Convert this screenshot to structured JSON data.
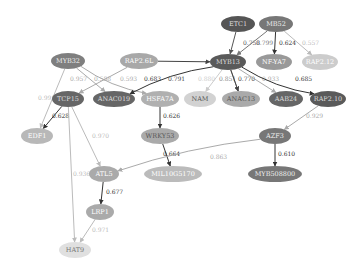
{
  "nodes": [
    {
      "id": "ETC1",
      "label": "ETC1",
      "x": 238,
      "y": 24,
      "rx": 17,
      "ry": 8,
      "fill": "#555555",
      "text": "#dddddd"
    },
    {
      "id": "MB52",
      "label": "MB52",
      "x": 276,
      "y": 24,
      "rx": 17,
      "ry": 8,
      "fill": "#777777",
      "text": "#eeeeee"
    },
    {
      "id": "MYB32",
      "label": "MYB32",
      "x": 68,
      "y": 61,
      "rx": 17,
      "ry": 8,
      "fill": "#7f7f7f",
      "text": "#eeeeee"
    },
    {
      "id": "RAP26L",
      "label": "RAP2.6L",
      "x": 139,
      "y": 61,
      "rx": 19,
      "ry": 8,
      "fill": "#a8a8a8",
      "text": "#ffffff"
    },
    {
      "id": "MYB13",
      "label": "MYB13",
      "x": 228,
      "y": 62,
      "rx": 18,
      "ry": 8,
      "fill": "#5a5a5a",
      "text": "#dddddd"
    },
    {
      "id": "NFYA7",
      "label": "NF-YA7",
      "x": 274,
      "y": 62,
      "rx": 18,
      "ry": 8,
      "fill": "#999999",
      "text": "#ffffff"
    },
    {
      "id": "RAP212",
      "label": "RAP2.12",
      "x": 320,
      "y": 62,
      "rx": 18,
      "ry": 8,
      "fill": "#cccccc",
      "text": "#ffffff"
    },
    {
      "id": "TCP15",
      "label": "TCP15",
      "x": 68,
      "y": 99,
      "rx": 16,
      "ry": 8,
      "fill": "#666666",
      "text": "#dddddd"
    },
    {
      "id": "ANAC019",
      "label": "ANAC019",
      "x": 114,
      "y": 99,
      "rx": 21,
      "ry": 8,
      "fill": "#666666",
      "text": "#dddddd"
    },
    {
      "id": "HSFA7A",
      "label": "HSFA7A",
      "x": 160,
      "y": 99,
      "rx": 19,
      "ry": 8,
      "fill": "#b0b0b0",
      "text": "#ffffff"
    },
    {
      "id": "NAM",
      "label": "NAM",
      "x": 200,
      "y": 99,
      "rx": 16,
      "ry": 8,
      "fill": "#d2d2d2",
      "text": "#555555"
    },
    {
      "id": "ANAC13",
      "label": "ANAC13",
      "x": 241,
      "y": 99,
      "rx": 19,
      "ry": 8,
      "fill": "#aaaaaa",
      "text": "#555555"
    },
    {
      "id": "AAB24",
      "label": "AAB24",
      "x": 286,
      "y": 99,
      "rx": 17,
      "ry": 8,
      "fill": "#666666",
      "text": "#dddddd"
    },
    {
      "id": "RAP210",
      "label": "RAP2.10",
      "x": 328,
      "y": 99,
      "rx": 18,
      "ry": 8,
      "fill": "#5a5a5a",
      "text": "#dddddd"
    },
    {
      "id": "EDF1",
      "label": "EDF1",
      "x": 37,
      "y": 136,
      "rx": 16,
      "ry": 8,
      "fill": "#b8b8b8",
      "text": "#ffffff"
    },
    {
      "id": "WRKY53",
      "label": "WRKY53",
      "x": 160,
      "y": 136,
      "rx": 19,
      "ry": 8,
      "fill": "#aaaaaa",
      "text": "#555555"
    },
    {
      "id": "AZF3",
      "label": "AZF3",
      "x": 275,
      "y": 136,
      "rx": 16,
      "ry": 8,
      "fill": "#777777",
      "text": "#eeeeee"
    },
    {
      "id": "ATL5",
      "label": "ATL5",
      "x": 104,
      "y": 174,
      "rx": 15,
      "ry": 8,
      "fill": "#aaaaaa",
      "text": "#ffffff"
    },
    {
      "id": "MIL",
      "label": "MIL10G5170",
      "x": 173,
      "y": 174,
      "rx": 29,
      "ry": 8,
      "fill": "#bbbbbb",
      "text": "#ffffff"
    },
    {
      "id": "MYB",
      "label": "MYB508800",
      "x": 275,
      "y": 174,
      "rx": 27,
      "ry": 8,
      "fill": "#777777",
      "text": "#eeeeee"
    },
    {
      "id": "LRP1",
      "label": "LRP1",
      "x": 100,
      "y": 212,
      "rx": 14,
      "ry": 8,
      "fill": "#aaaaaa",
      "text": "#ffffff"
    },
    {
      "id": "HAT9",
      "label": "HAT9",
      "x": 75,
      "y": 250,
      "rx": 16,
      "ry": 8,
      "fill": "#e0e0e0",
      "text": "#777777"
    }
  ],
  "edges": [
    {
      "from": "ETC1",
      "to": "MYB13",
      "label": "0.758",
      "color": "#555555",
      "lx": 243,
      "ly": 45
    },
    {
      "from": "MB52",
      "to": "MYB13",
      "label": "0.799",
      "color": "#777777",
      "lx": 256,
      "ly": 45
    },
    {
      "from": "MB52",
      "to": "NFYA7",
      "label": "0.624",
      "color": "#333333",
      "lx": 279,
      "ly": 45
    },
    {
      "from": "MB52",
      "to": "RAP212",
      "label": "0.557",
      "color": "#bbbbbb",
      "lx": 302,
      "ly": 45
    },
    {
      "from": "MYB32",
      "to": "EDF1",
      "label": "0.991",
      "color": "#bbbbbb",
      "lx": 38,
      "ly": 100
    },
    {
      "from": "MYB32",
      "to": "ANAC019",
      "label": "0.957",
      "color": "#aaaaaa",
      "lx": 70,
      "ly": 81
    },
    {
      "from": "MYB32",
      "to": "HSFA7A",
      "label": "0.593",
      "color": "#aaaaaa",
      "lx": 120,
      "ly": 81
    },
    {
      "from": "RAP26L",
      "to": "TCP15",
      "label": "0.588",
      "color": "#aaaaaa",
      "lx": 94,
      "ly": 81
    },
    {
      "from": "RAP26L",
      "to": "MYB13",
      "label": "0.791",
      "color": "#444444",
      "lx": 168,
      "ly": 81
    },
    {
      "from": "MYB13",
      "to": "ANAC019",
      "label": "0.683",
      "color": "#333333",
      "lx": 144,
      "ly": 81
    },
    {
      "from": "MYB13",
      "to": "NAM",
      "label": "0.880",
      "color": "#cccccc",
      "lx": 198,
      "ly": 81
    },
    {
      "from": "MYB13",
      "to": "ANAC13",
      "label": "0.851",
      "color": "#888888",
      "lx": 219,
      "ly": 81
    },
    {
      "from": "MYB13",
      "to": "ANAC13",
      "label": "0.770",
      "color": "#444444",
      "lx": 238,
      "ly": 81
    },
    {
      "from": "MYB13",
      "to": "AAB24",
      "label": "0.933",
      "color": "#aaaaaa",
      "lx": 262,
      "ly": 81
    },
    {
      "from": "MYB13",
      "to": "RAP210",
      "label": "0.685",
      "color": "#333333",
      "lx": 295,
      "ly": 81
    },
    {
      "from": "TCP15",
      "to": "EDF1",
      "label": "0.628",
      "color": "#333333",
      "lx": 52,
      "ly": 118
    },
    {
      "from": "TCP15",
      "to": "ATL5",
      "label": "0.970",
      "color": "#bbbbbb",
      "lx": 92,
      "ly": 138
    },
    {
      "from": "TCP15",
      "to": "HAT9",
      "label": "0.936",
      "color": "#bbbbbb",
      "lx": 73,
      "ly": 176
    },
    {
      "from": "HSFA7A",
      "to": "WRKY53",
      "label": "0.626",
      "color": "#333333",
      "lx": 163,
      "ly": 118
    },
    {
      "from": "RAP210",
      "to": "AZF3",
      "label": "0.929",
      "color": "#aaaaaa",
      "lx": 306,
      "ly": 118
    },
    {
      "from": "WRKY53",
      "to": "MIL",
      "label": "0.664",
      "color": "#333333",
      "lx": 163,
      "ly": 156
    },
    {
      "from": "AZF3",
      "to": "ATL5",
      "label": "0.863",
      "color": "#aaaaaa",
      "lx": 210,
      "ly": 159
    },
    {
      "from": "AZF3",
      "to": "MYB",
      "label": "0.610",
      "color": "#333333",
      "lx": 278,
      "ly": 156
    },
    {
      "from": "ATL5",
      "to": "LRP1",
      "label": "0.677",
      "color": "#333333",
      "lx": 106,
      "ly": 194
    },
    {
      "from": "LRP1",
      "to": "HAT9",
      "label": "0.971",
      "color": "#bbbbbb",
      "lx": 92,
      "ly": 232
    }
  ]
}
